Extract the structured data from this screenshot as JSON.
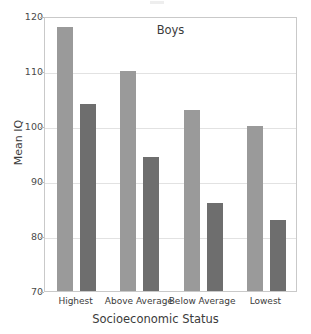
{
  "chart_data": {
    "type": "bar",
    "title": "Boys",
    "xlabel": "Socioeconomic Status",
    "ylabel": "Mean IQ",
    "categories": [
      "Highest",
      "Above Average",
      "Below Average",
      "Lowest"
    ],
    "series": [
      {
        "name": "series-1",
        "color": "#9a9a9a",
        "values": [
          118,
          110,
          103,
          100
        ]
      },
      {
        "name": "series-2",
        "color": "#6e6e6e",
        "values": [
          104,
          94.4,
          86,
          83
        ]
      }
    ],
    "ylim": [
      70,
      120
    ],
    "yticks": [
      70,
      80,
      90,
      100,
      110,
      120
    ],
    "ytick_labels": [
      "70",
      "80",
      "90",
      "100",
      "110",
      "120"
    ],
    "grid": true,
    "legend": "none",
    "frame": true
  },
  "axis": {
    "y_label": "Mean IQ",
    "x_label": "Socioeconomic Status",
    "y_ticks": [
      "120",
      "110",
      "100",
      "90",
      "80",
      "70"
    ]
  },
  "title": "Boys"
}
